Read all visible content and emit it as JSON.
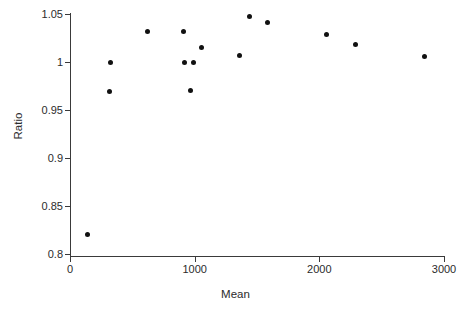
{
  "chart_data": {
    "type": "scatter",
    "title": "",
    "xlabel": "Mean",
    "ylabel": "Ratio",
    "xlim": [
      0,
      3000
    ],
    "ylim": [
      0.8,
      1.05
    ],
    "grid": false,
    "legend": null,
    "xticks": [
      0,
      1000,
      2000,
      3000
    ],
    "xtick_labels": [
      "0",
      "1000",
      "2000",
      "3000"
    ],
    "yticks": [
      0.8,
      0.85,
      0.9,
      0.95,
      1.0,
      1.05
    ],
    "ytick_labels": [
      "0.8",
      "0.85",
      "0.9",
      "0.95",
      "1",
      "1.05"
    ],
    "marker": "filled-circle",
    "marker_color": "#111111",
    "points": [
      {
        "x": 137,
        "y": 0.82
      },
      {
        "x": 313,
        "y": 0.969
      },
      {
        "x": 323,
        "y": 1.0
      },
      {
        "x": 622,
        "y": 1.032
      },
      {
        "x": 913,
        "y": 1.032
      },
      {
        "x": 922,
        "y": 1.0
      },
      {
        "x": 967,
        "y": 0.97
      },
      {
        "x": 994,
        "y": 1.0
      },
      {
        "x": 1053,
        "y": 1.015
      },
      {
        "x": 1360,
        "y": 1.007
      },
      {
        "x": 1439,
        "y": 1.047
      },
      {
        "x": 1582,
        "y": 1.041
      },
      {
        "x": 2061,
        "y": 1.029
      },
      {
        "x": 2293,
        "y": 1.018
      },
      {
        "x": 2843,
        "y": 1.006
      }
    ]
  },
  "axes": {
    "line_color": "#3a3a3a",
    "background": "#ffffff"
  }
}
